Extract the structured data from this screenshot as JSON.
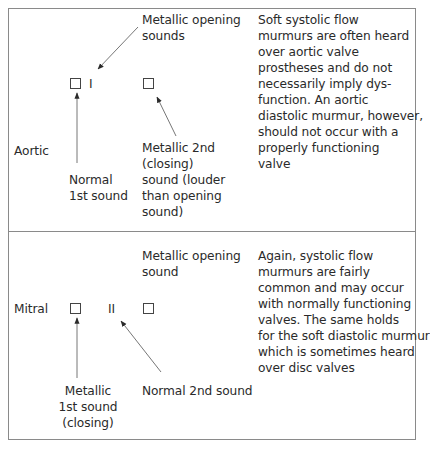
{
  "rows": [
    {
      "valve": "Aortic",
      "marker_label": "I",
      "top_annotation": "Metallic opening\nsounds",
      "left_annotation": "Normal\n1st sound",
      "right_annotation": "Metallic 2nd\n(closing)\nsound (louder\nthan opening\nsound)",
      "description": "Soft systolic flow\nmurmurs are often heard\nover aortic valve\nprostheses and do not\nnecessarily imply dys-\nfunction. An aortic\ndiastolic murmur, however,\nshould not occur with a\nproperly functioning\nvalve"
    },
    {
      "valve": "Mitral",
      "marker_label": "II",
      "top_annotation": "Metallic opening\nsound",
      "left_annotation": "Metallic\n1st sound\n(closing)",
      "right_annotation": "Normal 2nd sound",
      "description": "Again, systolic flow\nmurmurs are fairly\ncommon and may occur\nwith normally functioning\nvalves. The same holds\nfor the soft diastolic murmur\nwhich is sometimes heard\nover disc valves"
    }
  ],
  "colors": {
    "line": "#8a8a8a",
    "arrow": "#555555",
    "text": "#2a2a2a"
  }
}
